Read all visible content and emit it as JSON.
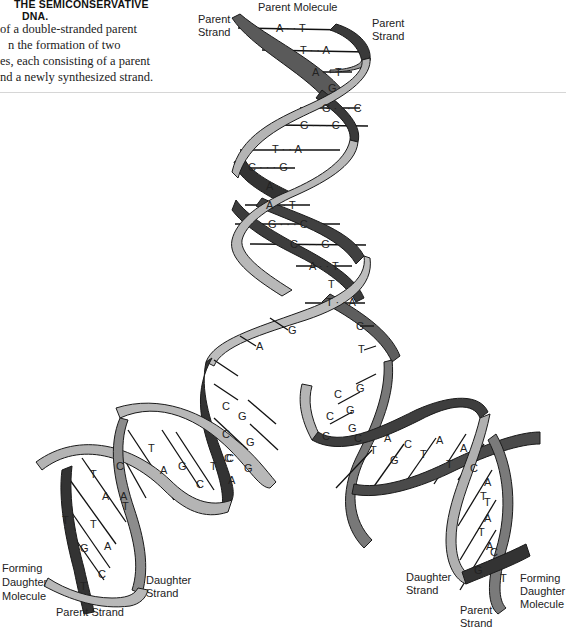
{
  "caption": {
    "title_line1": "THE SEMICONSERVATIVE",
    "title_line2": "DNA.",
    "body_lines": [
      "of a double-stranded parent",
      "n the formation of two",
      "es, each consisting of a parent",
      "nd a newly synthesized strand."
    ]
  },
  "labels": {
    "parent_molecule": "Parent Molecule",
    "parent_strand_top_left_1": "Parent",
    "parent_strand_top_left_2": "Strand",
    "parent_strand_top_right_1": "Parent",
    "parent_strand_top_right_2": "Strand",
    "forming_left_1": "Forming",
    "forming_left_2": "Daughter",
    "forming_left_3": "Molecule",
    "daughter_strand_left_1": "Daughter",
    "daughter_strand_left_2": "Strand",
    "parent_strand_bottom_left": "Parent Strand",
    "daughter_strand_right_1": "Daughter",
    "daughter_strand_right_2": "Strand",
    "parent_strand_bottom_right_1": "Parent",
    "parent_strand_bottom_right_2": "Strand",
    "forming_right_1": "Forming",
    "forming_right_2": "Daughter",
    "forming_right_3": "Molecule"
  },
  "parent_pairs": [
    {
      "text": "A · · T"
    },
    {
      "text": "T · · A"
    },
    {
      "text": "A · · T"
    },
    {
      "text": "G"
    },
    {
      "text": "G · · · C"
    },
    {
      "text": "G · · · C"
    },
    {
      "text": "T · · A"
    },
    {
      "text": "C · · · G"
    },
    {
      "text": "A"
    },
    {
      "text": "A · · T"
    },
    {
      "text": "G · · · C"
    },
    {
      "text": "C · · · G"
    },
    {
      "text": "A · · T"
    },
    {
      "text": "T"
    },
    {
      "text": "T · · A"
    }
  ],
  "fork_unpaired": {
    "left": [
      "G",
      "A"
    ],
    "right": [
      "C",
      "T"
    ]
  },
  "left_daughter_bases": [
    "C",
    "G",
    "C",
    "G",
    "C",
    "G",
    "G",
    "C",
    "C",
    "T",
    "A",
    "T",
    "A",
    "C",
    "A",
    "T",
    "T",
    "A",
    "T",
    "A",
    "G",
    "C",
    "T",
    "T"
  ],
  "right_daughter_bases": [
    "C",
    "G",
    "C",
    "G",
    "C",
    "G",
    "C",
    "T",
    "A",
    "G",
    "C",
    "T",
    "A",
    "T",
    "A",
    "C",
    "A",
    "T",
    "T",
    "A",
    "T",
    "A",
    "G",
    "C",
    "T"
  ],
  "colors": {
    "dark_strand": "#3a3a3a",
    "mid_strand": "#6e6e6e",
    "light_strand": "#b4b4b4",
    "outline": "#1a1a1a",
    "divider": "#d6d6d6"
  }
}
